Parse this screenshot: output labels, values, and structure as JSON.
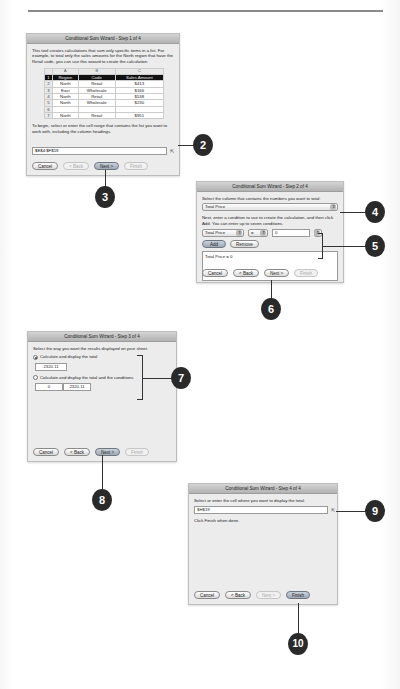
{
  "step1": {
    "title": "Conditional Sum Wizard - Step 1 of 4",
    "intro": "This tool creates calculations that sum only specific items in a list. For example, to total only the sales amounts for the North region that have the Retail code, you can use this wizard to create the calculation.",
    "sheet": {
      "col_headers": [
        "",
        "A",
        "B",
        "C"
      ],
      "rows": [
        {
          "n": "1",
          "cells": [
            "Region",
            "Code",
            "Sales Amount"
          ],
          "header": true
        },
        {
          "n": "2",
          "cells": [
            "North",
            "Retail",
            "$413"
          ]
        },
        {
          "n": "3",
          "cells": [
            "East",
            "Wholesale",
            "$166"
          ]
        },
        {
          "n": "4",
          "cells": [
            "North",
            "Retail",
            "$538"
          ]
        },
        {
          "n": "5",
          "cells": [
            "North",
            "Wholesale",
            "$230"
          ]
        },
        {
          "n": "6",
          "cells": [
            "",
            "",
            ""
          ]
        },
        {
          "n": "7",
          "cells": [
            "North",
            "Retail",
            "$951"
          ]
        }
      ]
    },
    "instruction": "To begin, select or enter the cell range that contains the list you want to work with, including the column headings.",
    "range_value": "$E$4:$F$19",
    "buttons": {
      "cancel": "Cancel",
      "back": "< Back",
      "next": "Next >",
      "finish": "Finish"
    }
  },
  "step2": {
    "title": "Conditional Sum Wizard - Step 2 of 4",
    "column_prompt": "Select the column that contains the numbers you want to total:",
    "column_value": "Total Price",
    "condition_prompt": "Next, enter a condition to use to create the calculation, and then click Add. You can enter up to seven conditions.",
    "condition_column": "Total Price",
    "condition_operator": "=",
    "condition_value": "0",
    "add_label": "Add",
    "remove_label": "Remove",
    "conditions_list": [
      "Total Price = 0"
    ],
    "buttons": {
      "cancel": "Cancel",
      "back": "< Back",
      "next": "Next >",
      "finish": "Finish"
    }
  },
  "step3": {
    "title": "Conditional Sum Wizard - Step 3 of 4",
    "prompt": "Select the way you want the results displayed on your sheet.",
    "option1_label": "Calculate and display the total",
    "option1_value": "2320.11",
    "option2_label": "Calculate and display the total and the conditions",
    "option2_cond_value": "0",
    "option2_total_value": "2320.11",
    "buttons": {
      "cancel": "Cancel",
      "back": "< Back",
      "next": "Next >",
      "finish": "Finish"
    }
  },
  "step4": {
    "title": "Conditional Sum Wizard - Step 4 of 4",
    "prompt": "Select or enter the cell where you want to display the total.",
    "cell_value": "$H$19",
    "finish_note": "Click Finish when done.",
    "buttons": {
      "cancel": "Cancel",
      "back": "< Back",
      "next": "Next >",
      "finish": "Finish"
    }
  },
  "callouts": [
    "2",
    "3",
    "4",
    "5",
    "6",
    "7",
    "8",
    "9",
    "10"
  ]
}
